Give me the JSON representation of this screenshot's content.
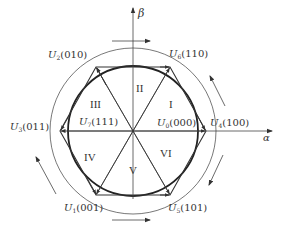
{
  "diagram": {
    "title": "",
    "axes": {
      "alpha_label": "α",
      "beta_label": "β"
    },
    "vectors": [
      {
        "id": "U4",
        "symbol": "U",
        "sub": "4",
        "state": "(100)"
      },
      {
        "id": "U6",
        "symbol": "U",
        "sub": "6",
        "state": "(110)"
      },
      {
        "id": "U2",
        "symbol": "U",
        "sub": "2",
        "state": "(010)"
      },
      {
        "id": "U3",
        "symbol": "U",
        "sub": "3",
        "state": "(011)"
      },
      {
        "id": "U1",
        "symbol": "U",
        "sub": "1",
        "state": "(001)"
      },
      {
        "id": "U5",
        "symbol": "U",
        "sub": "5",
        "state": "(101)"
      }
    ],
    "zero_vectors": [
      {
        "id": "U0",
        "symbol": "U",
        "sub": "0",
        "state": "(000)"
      },
      {
        "id": "U7",
        "symbol": "U",
        "sub": "7",
        "state": "(111)"
      }
    ],
    "sectors": [
      "I",
      "II",
      "III",
      "IV",
      "V",
      "VI"
    ],
    "colors": {
      "line": "#333333",
      "thin_line": "#555555",
      "text": "#333333",
      "background": "#ffffff"
    }
  }
}
